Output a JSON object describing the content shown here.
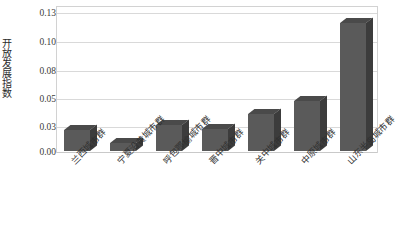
{
  "chart_data": {
    "type": "bar",
    "title": "",
    "xlabel": "",
    "ylabel": "开放发展指数",
    "categories": [
      "兰西城市群",
      "宁夏沿黄城市群",
      "呼包鄂榆城市群",
      "晋中城市群",
      "关中城市群",
      "中原城市群",
      "山东半岛城市群"
    ],
    "values": [
      0.019,
      0.007,
      0.023,
      0.02,
      0.033,
      0.045,
      0.115
    ],
    "ylim": [
      0.0,
      0.13
    ],
    "yticks": [
      "0.00",
      "0.03",
      "0.05",
      "0.08",
      "0.10",
      "0.13"
    ],
    "ytick_values": [
      0.0,
      0.03,
      0.05,
      0.08,
      0.1,
      0.13
    ],
    "grid": true,
    "legend": false,
    "legend_position": "none",
    "style": "3d-bar",
    "colors": {
      "bar_front": "#5a5a5a",
      "bar_side": "#3c3c3c",
      "bar_top": "#4a4a4a",
      "gridline": "#d9d9d9",
      "frame": "#d2d2d2",
      "text": "#2f2f2f",
      "background": "#ffffff"
    }
  }
}
